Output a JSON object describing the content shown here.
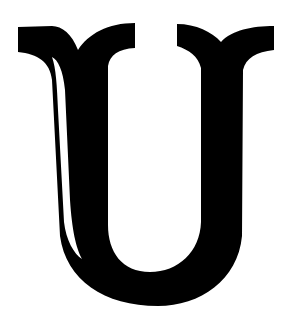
{
  "image": {
    "letter": "U",
    "description": "Decorative black serif capital letter U on white background",
    "colors": {
      "background": "#ffffff",
      "glyph": "#000000"
    }
  }
}
